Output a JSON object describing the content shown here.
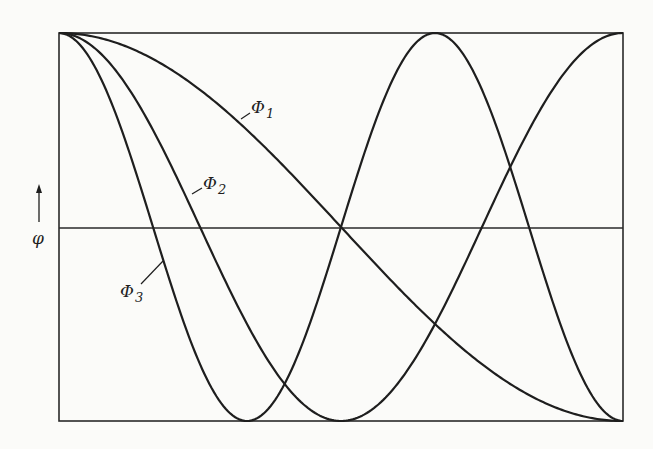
{
  "figure": {
    "y_axis_label": "φ",
    "y_axis_arrow": "up-arrow",
    "labels": [
      {
        "id": "phi1",
        "symbol": "Φ",
        "subscript": "1"
      },
      {
        "id": "phi2",
        "symbol": "Φ",
        "subscript": "2"
      },
      {
        "id": "phi3",
        "symbol": "Φ",
        "subscript": "3"
      }
    ],
    "colors": {
      "line": "#1e1e1e",
      "frame": "#2a2a2a",
      "background": "#fbfbf9"
    }
  },
  "chart_data": {
    "type": "line",
    "title": "",
    "xlabel": "",
    "ylabel": "φ",
    "xlim": [
      0,
      1
    ],
    "ylim": [
      -1,
      1
    ],
    "grid": false,
    "legend": "inline labels with leader lines",
    "x": [
      0,
      0.0833,
      0.1667,
      0.25,
      0.3333,
      0.4167,
      0.5,
      0.5833,
      0.6667,
      0.75,
      0.8333,
      0.9167,
      1
    ],
    "series": [
      {
        "name": "Φ1",
        "values": [
          1,
          0.966,
          0.866,
          0.707,
          0.5,
          0.259,
          0,
          -0.259,
          -0.5,
          -0.707,
          -0.866,
          -0.966,
          -1
        ]
      },
      {
        "name": "Φ2",
        "values": [
          1,
          0.866,
          0.5,
          0,
          -0.5,
          -0.866,
          -1,
          -0.866,
          -0.5,
          0,
          0.5,
          0.866,
          1
        ]
      },
      {
        "name": "Φ3",
        "values": [
          1,
          0.707,
          0,
          -0.707,
          -1,
          -0.707,
          0,
          0.707,
          1,
          0.707,
          0,
          -0.707,
          -1
        ]
      }
    ],
    "annotations": [
      "Φ1",
      "Φ2",
      "Φ3",
      "φ ↑"
    ]
  }
}
